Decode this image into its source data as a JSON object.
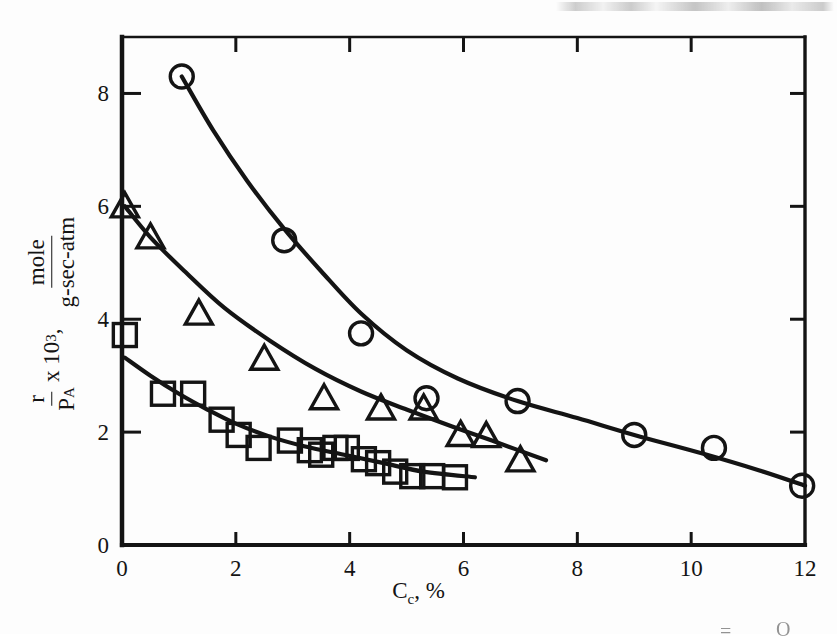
{
  "chart_data": {
    "type": "scatter",
    "title": "",
    "subtitle": "",
    "xlabel": "C_c, %",
    "xlabel_base": "C",
    "xlabel_sub": "c",
    "xlabel_tail": ", %",
    "ylabel_parts": {
      "fraction_left_num": "r",
      "fraction_left_den_base": "P",
      "fraction_left_den_sub": "A",
      "times": " x 10",
      "exponent": "3",
      "comma": ",",
      "fraction_right_num": "mole",
      "fraction_right_den": "g-sec-atm"
    },
    "ylabel": "r/P_A x 10^3, mole/g-sec-atm",
    "xlim": [
      0,
      12
    ],
    "ylim": [
      0,
      9
    ],
    "xticks": [
      0,
      2,
      4,
      6,
      8,
      10,
      12
    ],
    "xtick_labels": [
      "0",
      "2",
      "4",
      "6",
      "8",
      "10",
      "12"
    ],
    "yticks": [
      0,
      2,
      4,
      6,
      8
    ],
    "ytick_labels": [
      "0",
      "2",
      "4",
      "6",
      "8"
    ],
    "grid": false,
    "legend": false,
    "frame": "box",
    "tick_direction": "in",
    "series": [
      {
        "name": "circles",
        "marker": "circle",
        "points": [
          {
            "x": 1.05,
            "y": 8.3
          },
          {
            "x": 2.85,
            "y": 5.4
          },
          {
            "x": 4.2,
            "y": 3.75
          },
          {
            "x": 5.35,
            "y": 2.6
          },
          {
            "x": 6.95,
            "y": 2.55
          },
          {
            "x": 9.0,
            "y": 1.95
          },
          {
            "x": 10.4,
            "y": 1.72
          },
          {
            "x": 11.95,
            "y": 1.05
          }
        ],
        "curve": [
          {
            "x": 1.05,
            "y": 8.3
          },
          {
            "x": 1.6,
            "y": 7.35
          },
          {
            "x": 2.2,
            "y": 6.45
          },
          {
            "x": 2.85,
            "y": 5.6
          },
          {
            "x": 3.5,
            "y": 4.85
          },
          {
            "x": 4.2,
            "y": 4.1
          },
          {
            "x": 5.0,
            "y": 3.45
          },
          {
            "x": 5.9,
            "y": 2.95
          },
          {
            "x": 6.95,
            "y": 2.55
          },
          {
            "x": 8.0,
            "y": 2.25
          },
          {
            "x": 9.0,
            "y": 1.95
          },
          {
            "x": 10.2,
            "y": 1.62
          },
          {
            "x": 11.2,
            "y": 1.32
          },
          {
            "x": 12.0,
            "y": 1.05
          }
        ]
      },
      {
        "name": "triangles",
        "marker": "triangle",
        "points": [
          {
            "x": 0.05,
            "y": 6.0
          },
          {
            "x": 0.5,
            "y": 5.45
          },
          {
            "x": 1.35,
            "y": 4.1
          },
          {
            "x": 2.5,
            "y": 3.3
          },
          {
            "x": 3.55,
            "y": 2.6
          },
          {
            "x": 4.55,
            "y": 2.42
          },
          {
            "x": 5.3,
            "y": 2.42
          },
          {
            "x": 5.95,
            "y": 1.95
          },
          {
            "x": 6.4,
            "y": 1.93
          },
          {
            "x": 7.0,
            "y": 1.5
          }
        ],
        "curve": [
          {
            "x": 0.05,
            "y": 6.0
          },
          {
            "x": 0.5,
            "y": 5.45
          },
          {
            "x": 1.1,
            "y": 4.85
          },
          {
            "x": 1.8,
            "y": 4.2
          },
          {
            "x": 2.6,
            "y": 3.62
          },
          {
            "x": 3.4,
            "y": 3.12
          },
          {
            "x": 4.2,
            "y": 2.72
          },
          {
            "x": 5.0,
            "y": 2.4
          },
          {
            "x": 5.8,
            "y": 2.1
          },
          {
            "x": 6.5,
            "y": 1.85
          },
          {
            "x": 7.45,
            "y": 1.5
          }
        ]
      },
      {
        "name": "squares",
        "marker": "square",
        "points": [
          {
            "x": 0.05,
            "y": 3.72
          },
          {
            "x": 0.72,
            "y": 2.68
          },
          {
            "x": 1.25,
            "y": 2.68
          },
          {
            "x": 1.75,
            "y": 2.22
          },
          {
            "x": 2.05,
            "y": 1.95
          },
          {
            "x": 2.4,
            "y": 1.72
          },
          {
            "x": 2.95,
            "y": 1.85
          },
          {
            "x": 3.3,
            "y": 1.68
          },
          {
            "x": 3.5,
            "y": 1.6
          },
          {
            "x": 3.75,
            "y": 1.72
          },
          {
            "x": 3.95,
            "y": 1.72
          },
          {
            "x": 4.25,
            "y": 1.52
          },
          {
            "x": 4.5,
            "y": 1.45
          },
          {
            "x": 4.8,
            "y": 1.3
          },
          {
            "x": 5.1,
            "y": 1.22
          },
          {
            "x": 5.45,
            "y": 1.22
          },
          {
            "x": 5.85,
            "y": 1.2
          }
        ],
        "curve": [
          {
            "x": 0.05,
            "y": 3.32
          },
          {
            "x": 0.5,
            "y": 3.0
          },
          {
            "x": 1.0,
            "y": 2.68
          },
          {
            "x": 1.5,
            "y": 2.4
          },
          {
            "x": 2.0,
            "y": 2.15
          },
          {
            "x": 2.6,
            "y": 1.92
          },
          {
            "x": 3.2,
            "y": 1.75
          },
          {
            "x": 3.9,
            "y": 1.6
          },
          {
            "x": 4.6,
            "y": 1.45
          },
          {
            "x": 5.3,
            "y": 1.3
          },
          {
            "x": 6.2,
            "y": 1.2
          }
        ]
      }
    ],
    "colors": {
      "ink": "#141414",
      "background": "#ffffff"
    }
  },
  "artifacts": {
    "top_edge_smear": "scanned-page-edge-text-cut-off",
    "bottom_right_glyphs": [
      "=",
      "O"
    ]
  }
}
